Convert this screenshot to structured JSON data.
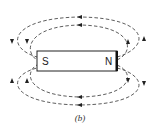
{
  "figure": {
    "caption": "(b)",
    "magnet": {
      "south_label": "S",
      "north_label": "N"
    },
    "field_lines": [
      {
        "name": "outer-top-loop"
      },
      {
        "name": "inner-top-loop"
      },
      {
        "name": "inner-bottom-loop"
      },
      {
        "name": "outer-bottom-loop"
      }
    ],
    "colors": {
      "line": "#333333",
      "magnet_fill": "#ffffff",
      "magnet_stroke": "#222222"
    }
  }
}
